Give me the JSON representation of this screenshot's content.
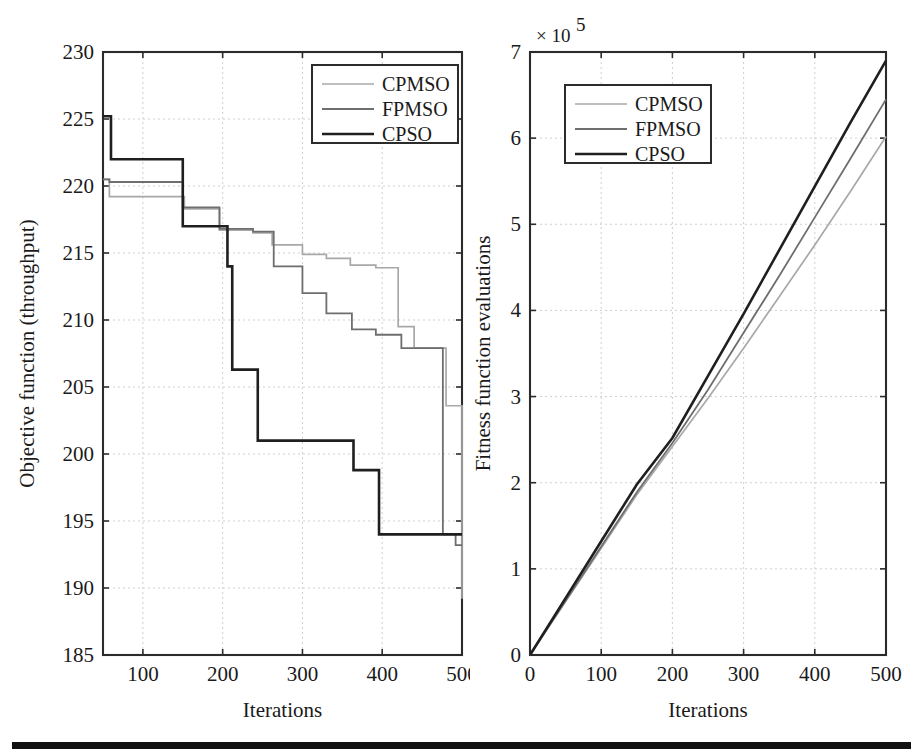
{
  "figure": {
    "background": "#ffffff",
    "rule_color": "#111111"
  },
  "palette": {
    "cpmso": "#a8a8a8",
    "fpmso": "#6e6e6e",
    "cpso": "#1f1f1f",
    "axis": "#2b2b2b",
    "grid": "#c9c9c9"
  },
  "chart_data": [
    {
      "id": "left",
      "type": "line",
      "step": "post",
      "title": "",
      "xlabel": "Iterations",
      "ylabel": "Objective function (throughput)",
      "xlim": [
        50,
        500
      ],
      "ylim": [
        185,
        230
      ],
      "xticks": [
        100,
        200,
        300,
        400,
        500
      ],
      "yticks": [
        185,
        190,
        195,
        200,
        205,
        210,
        215,
        220,
        225,
        230
      ],
      "xtick_labels": [
        "100",
        "200",
        "300",
        "400",
        "500"
      ],
      "ytick_labels": [
        "185",
        "190",
        "195",
        "200",
        "205",
        "210",
        "215",
        "220",
        "225",
        "230"
      ],
      "grid": true,
      "legend_position": "upper-right",
      "legend_entries": [
        "CPMSO",
        "FPMSO",
        "CPSO"
      ],
      "series": [
        {
          "name": "CPMSO",
          "color": "#a8a8a8",
          "x": [
            50,
            58,
            110,
            152,
            196,
            238,
            262,
            300,
            330,
            360,
            392,
            420,
            440,
            466,
            480,
            494,
            500
          ],
          "y": [
            220.5,
            219.2,
            219.2,
            218.3,
            216.7,
            216.5,
            215.6,
            214.9,
            214.6,
            214.1,
            213.9,
            209.5,
            207.9,
            207.9,
            203.6,
            203.6,
            189.2
          ]
        },
        {
          "name": "FPMSO",
          "color": "#6e6e6e",
          "x": [
            50,
            58,
            112,
            150,
            196,
            238,
            264,
            300,
            330,
            362,
            392,
            424,
            452,
            476,
            492,
            500
          ],
          "y": [
            220.5,
            220.3,
            220.3,
            218.4,
            216.8,
            216.6,
            214.0,
            212.0,
            210.5,
            209.3,
            208.9,
            207.9,
            207.9,
            194.0,
            193.2,
            193.2
          ]
        },
        {
          "name": "CPSO",
          "color": "#1f1f1f",
          "x": [
            50,
            56,
            60,
            110,
            150,
            172,
            206,
            212,
            238,
            244,
            358,
            364,
            390,
            396,
            424,
            500
          ],
          "y": [
            225.2,
            225.2,
            222.0,
            222.0,
            217.0,
            217.0,
            214.0,
            206.3,
            206.3,
            201.0,
            201.0,
            198.8,
            198.8,
            194.0,
            194.0,
            194.0
          ]
        }
      ]
    },
    {
      "id": "right",
      "type": "line",
      "title": "",
      "xlabel": "Iterations",
      "ylabel": "Fitness function evaluations",
      "y_exponent_label": "× 10",
      "y_exponent_power": "5",
      "xlim": [
        0,
        500
      ],
      "ylim": [
        0,
        7
      ],
      "xticks": [
        0,
        100,
        200,
        300,
        400,
        500
      ],
      "yticks": [
        0,
        1,
        2,
        3,
        4,
        5,
        6,
        7
      ],
      "xtick_labels": [
        "0",
        "100",
        "200",
        "300",
        "400",
        "500"
      ],
      "ytick_labels": [
        "0",
        "1",
        "2",
        "3",
        "4",
        "5",
        "6",
        "7"
      ],
      "grid": true,
      "legend_position": "upper-left",
      "legend_entries": [
        "CPMSO",
        "FPMSO",
        "CPSO"
      ],
      "series": [
        {
          "name": "CPMSO",
          "color": "#a8a8a8",
          "x": [
            0,
            50,
            100,
            150,
            200,
            250,
            300,
            350,
            400,
            450,
            500
          ],
          "y": [
            0.0,
            0.62,
            1.24,
            1.86,
            2.42,
            2.98,
            3.56,
            4.16,
            4.76,
            5.38,
            6.02
          ]
        },
        {
          "name": "FPMSO",
          "color": "#6e6e6e",
          "x": [
            0,
            50,
            100,
            150,
            200,
            250,
            300,
            350,
            400,
            450,
            500
          ],
          "y": [
            0.0,
            0.63,
            1.26,
            1.89,
            2.46,
            3.08,
            3.74,
            4.4,
            5.08,
            5.76,
            6.45
          ]
        },
        {
          "name": "CPSO",
          "color": "#1f1f1f",
          "x": [
            0,
            50,
            100,
            150,
            200,
            250,
            300,
            350,
            400,
            450,
            500
          ],
          "y": [
            0.0,
            0.66,
            1.32,
            1.98,
            2.52,
            3.24,
            3.96,
            4.7,
            5.44,
            6.18,
            6.9
          ]
        }
      ]
    }
  ]
}
